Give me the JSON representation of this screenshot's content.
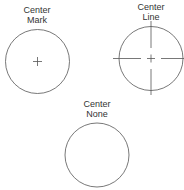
{
  "diagram": {
    "items": [
      {
        "title": "Center",
        "subtitle": "Mark",
        "style": "mark"
      },
      {
        "title": "Center",
        "subtitle": "Line",
        "style": "line"
      },
      {
        "title": "Center",
        "subtitle": "None",
        "style": "none"
      }
    ],
    "colors": {
      "stroke": "#555555",
      "text": "#333333"
    }
  }
}
